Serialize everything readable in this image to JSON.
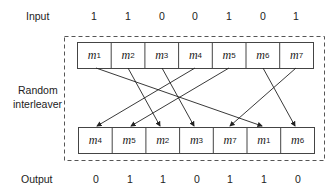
{
  "labels": {
    "input": "Input",
    "interleaver_line1": "Random",
    "interleaver_line2": "interleaver",
    "output": "Output"
  },
  "input_bits": [
    "1",
    "1",
    "0",
    "0",
    "1",
    "0",
    "1"
  ],
  "output_bits": [
    "0",
    "1",
    "1",
    "0",
    "1",
    "1",
    "0"
  ],
  "top_cells": [
    {
      "m": "m",
      "sub": "1"
    },
    {
      "m": "m",
      "sub": "2"
    },
    {
      "m": "m",
      "sub": "3"
    },
    {
      "m": "m",
      "sub": "4"
    },
    {
      "m": "m",
      "sub": "5"
    },
    {
      "m": "m",
      "sub": "6"
    },
    {
      "m": "m",
      "sub": "7"
    }
  ],
  "bottom_cells": [
    {
      "m": "m",
      "sub": "4"
    },
    {
      "m": "m",
      "sub": "5"
    },
    {
      "m": "m",
      "sub": "2"
    },
    {
      "m": "m",
      "sub": "3"
    },
    {
      "m": "m",
      "sub": "7"
    },
    {
      "m": "m",
      "sub": "1"
    },
    {
      "m": "m",
      "sub": "6"
    }
  ]
}
